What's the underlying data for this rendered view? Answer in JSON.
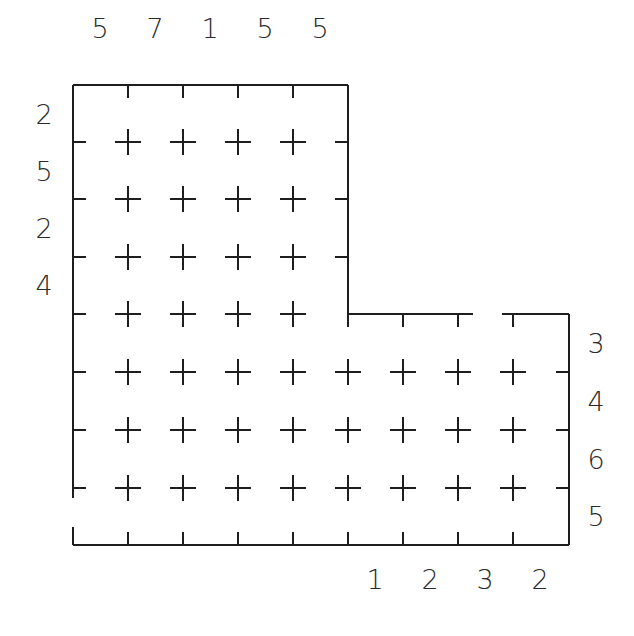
{
  "puzzle": {
    "type": "L-shaped grid puzzle with edge clues",
    "line_color": "#1e1e1e",
    "text_color": "#2a2a2a",
    "grid_x": [
      73,
      128,
      183,
      238,
      293,
      348,
      403,
      458,
      513,
      569
    ],
    "grid_y": [
      85,
      142,
      199,
      257,
      314,
      372,
      430,
      488,
      545
    ],
    "clues": {
      "top": [
        {
          "label": "5",
          "x": 100,
          "y": 28
        },
        {
          "label": "7",
          "x": 155,
          "y": 28
        },
        {
          "label": "1",
          "x": 210,
          "y": 28
        },
        {
          "label": "5",
          "x": 265,
          "y": 28
        },
        {
          "label": "5",
          "x": 320,
          "y": 28
        }
      ],
      "left": [
        {
          "label": "2",
          "x": 44,
          "y": 114
        },
        {
          "label": "5",
          "x": 44,
          "y": 171
        },
        {
          "label": "2",
          "x": 44,
          "y": 228
        },
        {
          "label": "4",
          "x": 44,
          "y": 285
        }
      ],
      "right": [
        {
          "label": "3",
          "x": 596,
          "y": 343
        },
        {
          "label": "4",
          "x": 596,
          "y": 401
        },
        {
          "label": "6",
          "x": 596,
          "y": 459
        },
        {
          "label": "5",
          "x": 596,
          "y": 516
        }
      ],
      "bottom": [
        {
          "label": "1",
          "x": 375,
          "y": 579
        },
        {
          "label": "2",
          "x": 430,
          "y": 579
        },
        {
          "label": "3",
          "x": 485,
          "y": 579
        },
        {
          "label": "2",
          "x": 540,
          "y": 579
        }
      ]
    }
  }
}
